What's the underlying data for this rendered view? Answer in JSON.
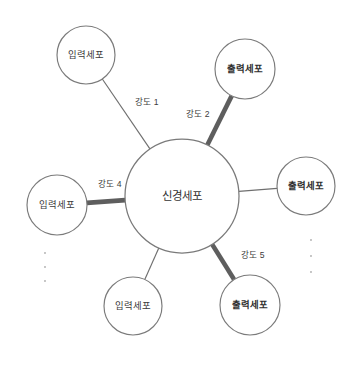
{
  "diagram": {
    "canvas": {
      "width": 361,
      "height": 365,
      "background": "#ffffff"
    },
    "colors": {
      "node_stroke": "#7a7a7a",
      "node_fill": "#ffffff",
      "edge_thin": "#6f6f6f",
      "edge_thick": "#5e5e5e",
      "label_text": "#3a3a3a",
      "ellipsis_dot": "#b9b9b9"
    },
    "hub": {
      "label": "신경세포",
      "cx": 182,
      "cy": 196,
      "r": 57
    },
    "nodes": [
      {
        "id": "input-top-left",
        "label": "입력세포",
        "role": "input",
        "bold": false,
        "cx": 86,
        "cy": 55,
        "r": 29
      },
      {
        "id": "output-top-right",
        "label": "출력세포",
        "role": "output",
        "bold": true,
        "cx": 245,
        "cy": 69,
        "r": 30
      },
      {
        "id": "output-right",
        "label": "출력세포",
        "role": "output",
        "bold": true,
        "cx": 306,
        "cy": 186,
        "r": 29
      },
      {
        "id": "output-bottom",
        "label": "출력세포",
        "role": "output",
        "bold": true,
        "cx": 250,
        "cy": 305,
        "r": 30
      },
      {
        "id": "input-bottom-left",
        "label": "입력세포",
        "role": "input",
        "bold": false,
        "cx": 133,
        "cy": 306,
        "r": 29
      },
      {
        "id": "input-left",
        "label": "입력세포",
        "role": "input",
        "bold": false,
        "cx": 57,
        "cy": 205,
        "r": 30
      }
    ],
    "edges": [
      {
        "id": "edge-1",
        "from": "input-top-left",
        "to": "hub",
        "weight": "thin",
        "label": "강도 1",
        "label_x": 147,
        "label_y": 103
      },
      {
        "id": "edge-2",
        "from": "output-top-right",
        "to": "hub",
        "weight": "thick",
        "label": "강도 2",
        "label_x": 198,
        "label_y": 115
      },
      {
        "id": "edge-3",
        "from": "output-right",
        "to": "hub",
        "weight": "thin",
        "label": "",
        "label_x": 0,
        "label_y": 0
      },
      {
        "id": "edge-5",
        "from": "output-bottom",
        "to": "hub",
        "weight": "thick",
        "label": "강도 5",
        "label_x": 253,
        "label_y": 256
      },
      {
        "id": "edge-6",
        "from": "input-bottom-left",
        "to": "hub",
        "weight": "thin",
        "label": "",
        "label_x": 0,
        "label_y": 0
      },
      {
        "id": "edge-4",
        "from": "input-left",
        "to": "hub",
        "weight": "thick",
        "label": "강도 4",
        "label_x": 110,
        "label_y": 185
      }
    ],
    "ellipses": [
      {
        "id": "ellipsis-left",
        "cx": 45,
        "dots_y": [
          253,
          267,
          281
        ]
      },
      {
        "id": "ellipsis-right",
        "cx": 311,
        "dots_y": [
          240,
          256,
          272
        ]
      }
    ]
  }
}
